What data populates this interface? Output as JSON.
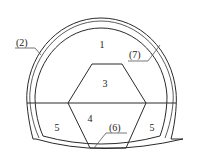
{
  "diagram": {
    "type": "tunnel-cross-section-excavation-sequence",
    "labels": {
      "region_1": "1",
      "region_3": "3",
      "region_4": "4",
      "region_5_left": "5",
      "region_5_right": "5",
      "callout_2": "(2)",
      "callout_6": "(6)",
      "callout_7": "(7)"
    },
    "colors": {
      "line": "#2a2a2a",
      "background": "#ffffff"
    }
  }
}
